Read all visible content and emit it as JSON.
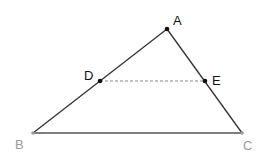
{
  "diagram": {
    "type": "triangle-with-midsegment",
    "points": {
      "A": {
        "label": "A",
        "x": 167,
        "y": 29,
        "color": "#111111"
      },
      "B": {
        "label": "B",
        "x": 33,
        "y": 133,
        "color": "#9a9a9a"
      },
      "C": {
        "label": "C",
        "x": 242,
        "y": 133,
        "color": "#9a9a9a"
      },
      "D": {
        "label": "D",
        "x": 100,
        "y": 81,
        "color": "#111111"
      },
      "E": {
        "label": "E",
        "x": 205,
        "y": 81,
        "color": "#111111"
      }
    },
    "segments": [
      {
        "from": "A",
        "to": "B",
        "style": "solid"
      },
      {
        "from": "A",
        "to": "C",
        "style": "solid"
      },
      {
        "from": "B",
        "to": "C",
        "style": "solid"
      },
      {
        "from": "D",
        "to": "E",
        "style": "dashed"
      }
    ],
    "colors": {
      "line": "#333333",
      "dashed": "#888888",
      "base": "#555555"
    }
  }
}
